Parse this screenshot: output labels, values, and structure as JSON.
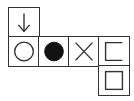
{
  "diagram": {
    "type": "cube-net",
    "colors": {
      "stroke": "#333333",
      "fill": "#111111",
      "background": "#ffffff"
    },
    "cells": [
      {
        "id": "top",
        "row": 0,
        "col": 0,
        "symbol": "down-arrow"
      },
      {
        "id": "mid-0",
        "row": 1,
        "col": 0,
        "symbol": "hollow-circle"
      },
      {
        "id": "mid-1",
        "row": 1,
        "col": 1,
        "symbol": "filled-circle"
      },
      {
        "id": "mid-2",
        "row": 1,
        "col": 2,
        "symbol": "x-cross"
      },
      {
        "id": "mid-3",
        "row": 1,
        "col": 3,
        "symbol": "square-open-right"
      },
      {
        "id": "bottom",
        "row": 2,
        "col": 3,
        "symbol": "square-inset"
      }
    ]
  }
}
